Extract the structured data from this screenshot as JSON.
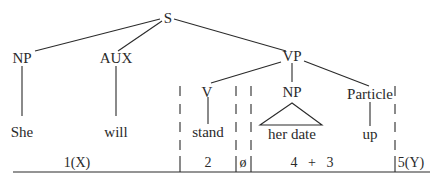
{
  "tree": {
    "root": "S",
    "nodes": {
      "S": "S",
      "NP_subject": "NP",
      "AUX": "AUX",
      "VP": "VP",
      "V": "V",
      "NP_object": "NP",
      "Particle": "Particle"
    },
    "words": {
      "she": "She",
      "will": "will",
      "stand": "stand",
      "her_date": "her date",
      "up": "up"
    }
  },
  "segmentation": {
    "segments": [
      {
        "id": "seg1",
        "label": "1(X)"
      },
      {
        "id": "seg2",
        "label": "2"
      },
      {
        "id": "seg-empty",
        "label": "ø"
      },
      {
        "id": "seg43",
        "label": "4   +   3"
      },
      {
        "id": "seg5",
        "label": "5(Y)"
      }
    ]
  },
  "colors": {
    "ink": "#2a2a2a",
    "background": "#ffffff"
  }
}
